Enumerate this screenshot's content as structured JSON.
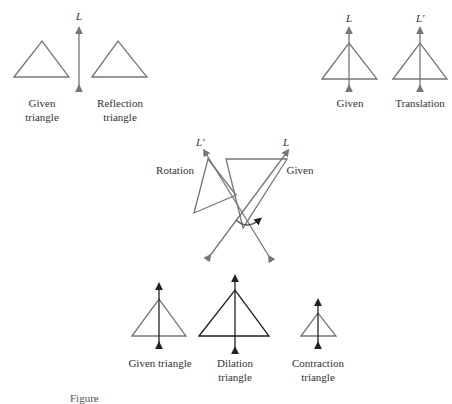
{
  "panels": {
    "reflection": {
      "line_label": "L",
      "given_label_1": "Given",
      "given_label_2": "triangle",
      "result_label_1": "Reflection",
      "result_label_2": "triangle"
    },
    "translation": {
      "given_line_label": "L",
      "result_line_label": "L′",
      "given_label": "Given",
      "result_label": "Translation"
    },
    "rotation": {
      "given_line_label": "L",
      "result_line_label": "L′",
      "given_label": "Given",
      "result_label": "Rotation"
    },
    "dilation": {
      "given_label": "Given triangle",
      "dilation_label_1": "Dilation",
      "dilation_label_2": "triangle",
      "contraction_label_1": "Contraction",
      "contraction_label_2": "triangle"
    }
  },
  "caption": "Figure"
}
